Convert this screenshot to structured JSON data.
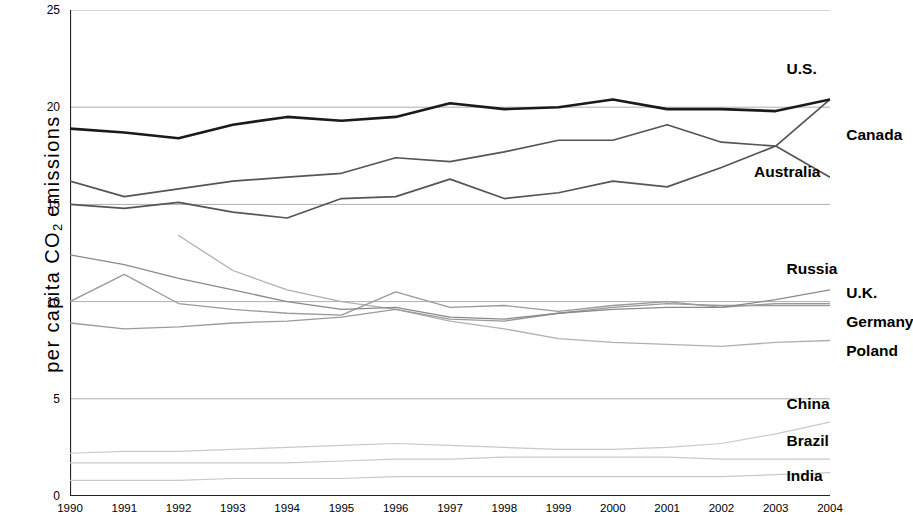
{
  "chart_data": {
    "type": "line",
    "title": "",
    "xlabel": "",
    "ylabel": "per capita CO2 emissions",
    "ylabel_parts": {
      "pre": "per capita CO",
      "sub": "2",
      "post": " emissions"
    },
    "x": [
      1990,
      1991,
      1992,
      1993,
      1994,
      1995,
      1996,
      1997,
      1998,
      1999,
      2000,
      2001,
      2002,
      2003,
      2004
    ],
    "categories": [
      "1990",
      "1991",
      "1992",
      "1993",
      "1994",
      "1995",
      "1996",
      "1997",
      "1998",
      "1999",
      "2000",
      "2001",
      "2002",
      "2003",
      "2004"
    ],
    "ylim": [
      0,
      25
    ],
    "xlim": [
      1990,
      2004
    ],
    "yticks": [
      0,
      5,
      10,
      15,
      20,
      25
    ],
    "yticklabels": [
      "0",
      "5",
      "10",
      "15",
      "20",
      "25"
    ],
    "grid": "horizontal",
    "legend": "right-end-labels",
    "series": [
      {
        "name": "U.S.",
        "color": "#1a1a1a",
        "width": 2.6,
        "label_x": 2003.2,
        "label_y": 21.9,
        "values": [
          18.9,
          18.7,
          18.4,
          19.1,
          19.5,
          19.3,
          19.5,
          20.2,
          19.9,
          20.0,
          20.4,
          19.9,
          19.9,
          19.8,
          20.4
        ]
      },
      {
        "name": "Canada",
        "color": "#555555",
        "width": 1.7,
        "label_x": 2004.3,
        "label_y": 18.5,
        "values": [
          16.2,
          15.4,
          15.8,
          16.2,
          16.4,
          16.6,
          17.4,
          17.2,
          17.7,
          18.3,
          18.3,
          19.1,
          18.2,
          18.0,
          16.4
        ]
      },
      {
        "name": "Australia",
        "color": "#555555",
        "width": 1.7,
        "label_x": 2002.6,
        "label_y": 16.6,
        "values": [
          15.0,
          14.8,
          15.1,
          14.6,
          14.3,
          15.3,
          15.4,
          16.3,
          15.3,
          15.6,
          16.2,
          15.9,
          16.9,
          18.0,
          20.4
        ]
      },
      {
        "name": "Russia",
        "color": "#8a8a8a",
        "width": 1.3,
        "label_x": 2003.2,
        "label_y": 11.6,
        "values": [
          12.4,
          11.9,
          11.2,
          10.6,
          10.0,
          9.6,
          9.7,
          9.2,
          9.1,
          9.4,
          9.6,
          9.7,
          9.7,
          10.1,
          10.6
        ]
      },
      {
        "name": "U.K.",
        "color": "#9a9a9a",
        "width": 1.3,
        "label_x": 2004.3,
        "label_y": 10.4,
        "values": [
          10.0,
          11.4,
          9.9,
          9.6,
          9.4,
          9.3,
          10.5,
          9.7,
          9.8,
          9.5,
          9.8,
          10.0,
          9.7,
          9.9,
          9.9
        ]
      },
      {
        "name": "Germany",
        "color": "#9a9a9a",
        "width": 1.3,
        "label_x": 2004.3,
        "label_y": 8.9,
        "values": [
          8.9,
          8.6,
          8.7,
          8.9,
          9.0,
          9.2,
          9.6,
          9.1,
          9.0,
          9.4,
          9.7,
          9.9,
          9.8,
          9.8,
          9.8
        ]
      },
      {
        "name": "Poland",
        "color": "#b0b0b0",
        "width": 1.3,
        "label_x": 2004.3,
        "label_y": 7.4,
        "values": [
          null,
          null,
          13.4,
          11.6,
          10.6,
          10.0,
          9.6,
          9.0,
          8.6,
          8.1,
          7.9,
          7.8,
          7.7,
          7.9,
          8.0
        ]
      },
      {
        "name": "China",
        "color": "#c9c9c9",
        "width": 1.2,
        "label_x": 2003.2,
        "label_y": 4.7,
        "values": [
          2.2,
          2.3,
          2.3,
          2.4,
          2.5,
          2.6,
          2.7,
          2.6,
          2.5,
          2.4,
          2.4,
          2.5,
          2.7,
          3.2,
          3.8
        ]
      },
      {
        "name": "Brazil",
        "color": "#c9c9c9",
        "width": 1.2,
        "label_x": 2003.2,
        "label_y": 2.8,
        "values": [
          1.7,
          1.7,
          1.7,
          1.7,
          1.7,
          1.8,
          1.9,
          1.9,
          2.0,
          2.0,
          2.0,
          2.0,
          1.9,
          1.9,
          1.9
        ]
      },
      {
        "name": "India",
        "color": "#c9c9c9",
        "width": 1.2,
        "label_x": 2003.2,
        "label_y": 1.0,
        "values": [
          0.8,
          0.8,
          0.8,
          0.9,
          0.9,
          0.9,
          1.0,
          1.0,
          1.0,
          1.0,
          1.0,
          1.0,
          1.0,
          1.1,
          1.2
        ]
      }
    ]
  }
}
